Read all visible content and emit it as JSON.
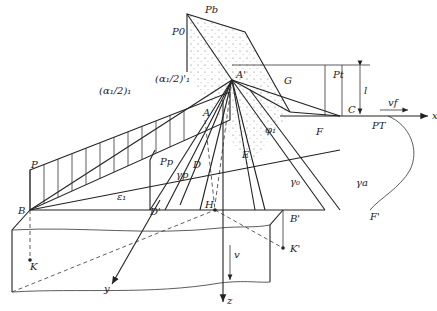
{
  "diagram": {
    "type": "geometric 3D construction",
    "points": {
      "P_0": "P0",
      "P_b": "Pb",
      "A_prime": "A'",
      "A": "A",
      "G": "G",
      "P_t": "Pt",
      "C": "C",
      "F": "F",
      "E": "E",
      "D": "D",
      "D_prime": "D'",
      "H": "H",
      "B": "B",
      "B_prime": "B'",
      "F_prime": "F'",
      "K": "K",
      "K_prime": "K'",
      "P": "P",
      "P_p": "Pp",
      "P_T": "PT"
    },
    "angles": {
      "alpha_half_1": "(α₁/2)₁",
      "alpha_half_1_prime": "(α₁/2)'₁",
      "epsilon_1": "ε₁",
      "phi_1": "φ₁",
      "gamma_p": "γp",
      "gamma_0": "γ₀",
      "gamma_a": "γa"
    },
    "axes": {
      "x": "x",
      "y": "y",
      "z": "z"
    },
    "vectors": {
      "v_f": "vf",
      "v": "v"
    },
    "dimension": {
      "l": "l"
    },
    "colors": {
      "line": "#222222",
      "background": "#ffffff"
    }
  }
}
